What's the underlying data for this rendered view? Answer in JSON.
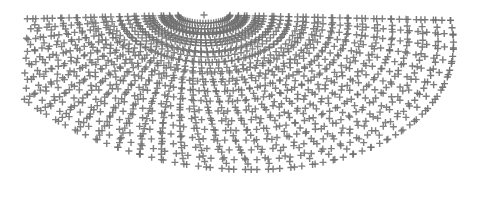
{
  "figure": {
    "width": 493,
    "height": 218,
    "background_color": "#ffffff",
    "title": "",
    "subtitle": "",
    "axes_visible": false,
    "axis_labels_visible": false,
    "tick_labels_visible": false,
    "legend_visible": false,
    "gridlines_visible": false,
    "border_visible": false,
    "annotations": []
  },
  "chart_data": {
    "type": "scatter",
    "title": "",
    "subtitle": "",
    "xlabel": "",
    "ylabel": "",
    "xlim": [
      0,
      493
    ],
    "ylim": [
      218,
      0
    ],
    "grid": false,
    "legend": false,
    "legend_position": "none",
    "marker": {
      "symbol": "plus",
      "color": "#6e6e6e",
      "size_px": 7,
      "stroke_width_px": 1.4,
      "opacity": 0.88
    },
    "series": [
      {
        "name": "mesh-points",
        "point_count_approx": 1050,
        "color": "#6e6e6e"
      }
    ],
    "geometry": {
      "projection": "oblique / flattened polar",
      "apex_point": [
        204,
        15
      ],
      "center": [
        250,
        196
      ],
      "radial_rings": 16,
      "spokes": 34,
      "ring_radius_start_x": 26,
      "ring_radius_step_x": 14.6,
      "ring_radius_start_y": 10,
      "ring_radius_step_y": 11.9,
      "ring_eccentricity": 0.82,
      "theta_start_deg": 182,
      "theta_end_deg": 358,
      "shear_x": 0.46,
      "x_extent": [
        28,
        472
      ],
      "y_extent": [
        11,
        199
      ],
      "dense_limb_right": true,
      "dense_rim_bottom": true
    },
    "axis_ranges": {
      "x": [
        0,
        493
      ],
      "y": [
        0,
        218
      ]
    },
    "tick_labels": {
      "x": [],
      "y": []
    }
  }
}
